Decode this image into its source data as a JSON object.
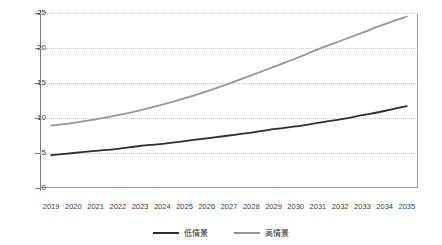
{
  "chart_data": {
    "type": "line",
    "title": "",
    "subtitle": "",
    "xlabel": "",
    "ylabel": "",
    "ylim": [
      0,
      25
    ],
    "yticks": [
      0,
      5,
      10,
      15,
      20,
      25
    ],
    "grid": true,
    "legend_position": "bottom",
    "categories": [
      "2019",
      "2020",
      "2021",
      "2022",
      "2023",
      "2024",
      "2025",
      "2026",
      "2027",
      "2028",
      "2029",
      "2030",
      "2031",
      "2032",
      "2033",
      "2034",
      "2035"
    ],
    "series": [
      {
        "name": "低情景",
        "color": "#2e2e2e",
        "values": [
          4.7,
          5.0,
          5.3,
          5.6,
          6.0,
          6.3,
          6.7,
          7.1,
          7.5,
          7.9,
          8.4,
          8.8,
          9.3,
          9.8,
          10.4,
          11.0,
          11.7
        ]
      },
      {
        "name": "高情景",
        "color": "#969696",
        "values": [
          8.9,
          9.3,
          9.8,
          10.4,
          11.1,
          11.9,
          12.8,
          13.8,
          14.9,
          16.1,
          17.3,
          18.5,
          19.8,
          21.0,
          22.2,
          23.4,
          24.5
        ]
      }
    ]
  },
  "colors": {
    "axis": "#7a7a7a",
    "gridline": "#c9c9c9",
    "plot_border": "#9a9a9a",
    "text": "#3a3a3a",
    "background": "#ffffff"
  }
}
